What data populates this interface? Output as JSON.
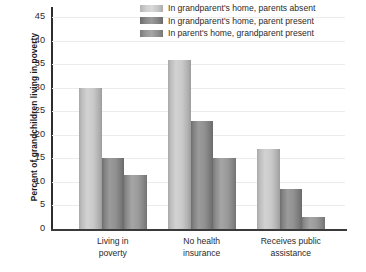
{
  "chart_data": {
    "type": "bar",
    "title": "",
    "subtitle": "",
    "xlabel": "",
    "ylabel": "Percent of grandchildren living in poverty",
    "ylim": [
      0,
      47
    ],
    "yticks": [
      0,
      5,
      10,
      15,
      20,
      25,
      30,
      35,
      40,
      45
    ],
    "ytick_labels": [
      "0",
      "5",
      "10",
      "15",
      "20",
      "25",
      "30",
      "35",
      "40",
      "45"
    ],
    "grid": "horizontal",
    "legend_position": "top-right",
    "categories": [
      "Living in poverty",
      "No health insurance",
      "Receives public assistance"
    ],
    "category_lines": [
      [
        "Living in",
        "poverty"
      ],
      [
        "No health",
        "insurance"
      ],
      [
        "Receives public",
        "assistance"
      ]
    ],
    "series": [
      {
        "name": "In grandparent's home, parents absent",
        "color": "#d2d2d2",
        "values": [
          30,
          36,
          17
        ]
      },
      {
        "name": "In grandparent's home, parent present",
        "color": "#9b9b9b",
        "values": [
          15,
          23,
          8.5
        ]
      },
      {
        "name": "In parent's home, grandparent present",
        "color": "#a5a5a5",
        "values": [
          11.5,
          15,
          2.5
        ]
      }
    ]
  },
  "legend": {
    "items": [
      "In grandparent's home, parents absent",
      "In grandparent's home, parent present",
      "In parent's home, grandparent present"
    ]
  },
  "axes": {
    "y_title": "Percent of grandchildren living in poverty"
  }
}
